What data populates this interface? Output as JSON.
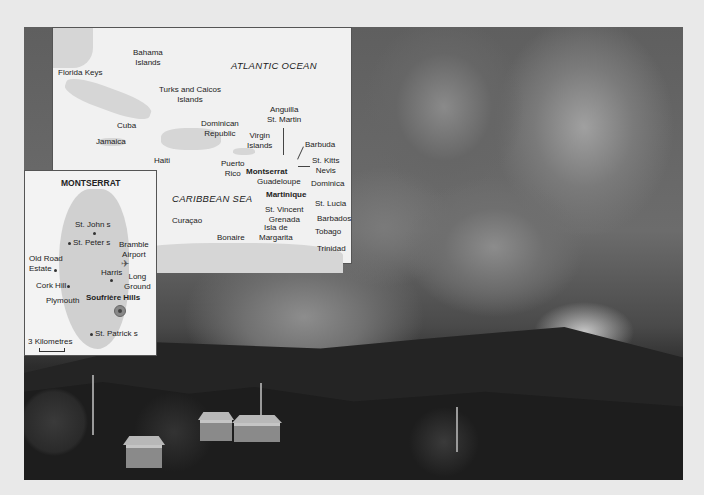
{
  "photo": {
    "subject": "volcanic eruption ash cloud over hillside with houses"
  },
  "caribbean_map": {
    "labels": {
      "florida_keys": "Florida Keys",
      "bahama_islands": "Bahama\nIslands",
      "atlantic_ocean": "ATLANTIC OCEAN",
      "turks_caicos": "Turks and Caicos\nIslands",
      "cuba": "Cuba",
      "jamaica": "Jamaica",
      "dominican_republic": "Dominican\nRepublic",
      "haiti": "Haiti",
      "virgin_islands": "Virgin\nIslands",
      "anguilla_st_martin": "Anguilla\nSt. Martin",
      "barbuda": "Barbuda",
      "st_kitts_nevis": "St. Kitts\nNevis",
      "puerto_rico": "Puerto\nRico",
      "montserrat": "Montserrat",
      "guadeloupe": "Guadeloupe",
      "dominica": "Dominica",
      "caribbean_sea": "CARIBBEAN SEA",
      "martinique": "Martinique",
      "st_lucia": "St. Lucia",
      "st_vincent_grenada": "St. Vincent\nGrenada",
      "curacao": "Curaçao",
      "barbados": "Barbados",
      "isla_de_margarita": "Isla de\nMargarita",
      "bonaire": "Bonaire",
      "tobago": "Tobago",
      "trinidad": "Trinidad"
    }
  },
  "montserrat_map": {
    "title": "MONTSERRAT",
    "labels": {
      "st_johns": "St. John s",
      "st_peters": "St. Peter s",
      "bramble_airport": "Bramble\nAirport",
      "old_road_estate": "Old Road\nEstate",
      "harris": "Harris",
      "long_ground": "Long\nGround",
      "cork_hill": "Cork Hill",
      "plymouth": "Plymouth",
      "soufriere_hills": "Soufrière Hills",
      "st_patricks": "St. Patrick s"
    },
    "scale_label": "3 Kilometres"
  }
}
